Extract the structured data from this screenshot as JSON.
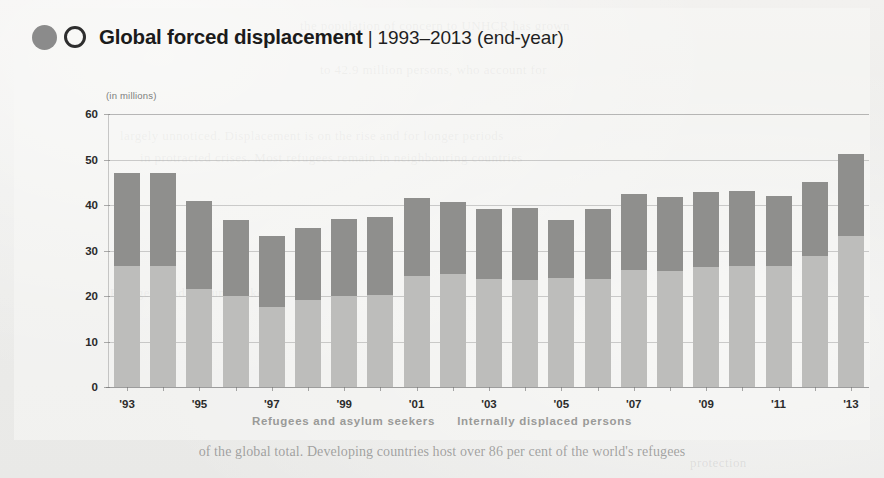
{
  "header": {
    "logo_filled": "filled-circle-icon",
    "logo_outline": "outline-circle-icon",
    "title": "Global forced displacement",
    "separator": "|",
    "subtitle": "1993–2013 (end-year)"
  },
  "units_label": "(in millions)",
  "legend": {
    "items": [
      {
        "label": "Refugees and asylum seekers",
        "color": "#8f8f8d"
      },
      {
        "label": "Internally displaced persons",
        "color": "#bdbdbb"
      }
    ]
  },
  "bottom_bleed_text": "of the global total. Developing countries host over 86 per cent of the world's refugees",
  "ghost_text": [
    "the population of concern to UNHCR has grown",
    "to 42.9 million persons, who account for",
    "largely unnoticed. Displacement is on the rise and for longer periods",
    "in protracted crises. Most refugees remain in neighbouring countries",
    "Refugees and asylum seekers",
    "protection"
  ],
  "chart_data": {
    "type": "bar",
    "stacked": true,
    "title": "Global forced displacement",
    "subtitle": "1993–2013 (end-year)",
    "xlabel": "",
    "ylabel": "(in millions)",
    "ylim": [
      0,
      60
    ],
    "yticks": [
      0,
      10,
      20,
      30,
      40,
      50,
      60
    ],
    "grid": true,
    "legend_position": "bottom",
    "categories": [
      "1993",
      "1994",
      "1995",
      "1996",
      "1997",
      "1998",
      "1999",
      "2000",
      "2001",
      "2002",
      "2003",
      "2004",
      "2005",
      "2006",
      "2007",
      "2008",
      "2009",
      "2010",
      "2011",
      "2012",
      "2013"
    ],
    "xtick_labels": [
      "'93",
      "",
      "'95",
      "",
      "'97",
      "",
      "'99",
      "",
      "'01",
      "",
      "'03",
      "",
      "'05",
      "",
      "'07",
      "",
      "'09",
      "",
      "'11",
      "",
      "'13"
    ],
    "series": [
      {
        "name": "Internally displaced persons",
        "color": "#bdbdbb",
        "values": [
          26.7,
          26.7,
          21.6,
          20.1,
          17.6,
          19.2,
          20.1,
          20.3,
          24.4,
          24.8,
          23.8,
          23.6,
          24.0,
          23.7,
          25.8,
          25.6,
          26.3,
          26.5,
          26.6,
          28.8,
          33.3
        ]
      },
      {
        "name": "Refugees and asylum seekers",
        "color": "#8f8f8d",
        "values": [
          20.3,
          20.3,
          19.2,
          16.5,
          15.7,
          15.7,
          16.9,
          17.1,
          17.1,
          15.8,
          15.4,
          15.7,
          12.8,
          15.5,
          16.7,
          16.2,
          16.6,
          16.6,
          15.4,
          16.2,
          17.9
        ]
      }
    ],
    "totals": [
      47.0,
      47.0,
      40.8,
      36.6,
      33.3,
      34.9,
      37.0,
      37.4,
      41.5,
      40.6,
      39.2,
      39.3,
      36.8,
      39.2,
      42.5,
      41.8,
      42.9,
      43.1,
      42.0,
      45.0,
      51.2
    ]
  }
}
